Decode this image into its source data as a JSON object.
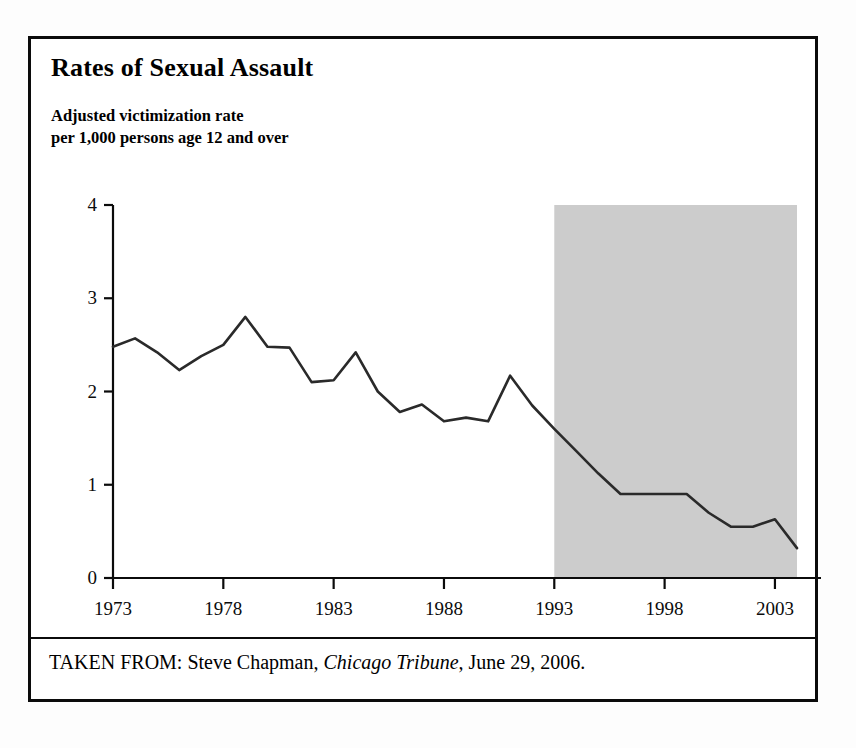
{
  "figure": {
    "title": "Rates of Sexual Assault",
    "subtitle": "Adjusted victimization rate\nper 1,000 persons age 12 and over",
    "caption": {
      "prefix": "TAKEN FROM: Steve Chapman, ",
      "source_italic": "Chicago Tribune",
      "suffix": ", June 29, 2006."
    },
    "colors": {
      "ink": "#0b0b0b",
      "line": "#2a2a2a",
      "shaded_band": "#cccccc",
      "background": "#ffffff"
    }
  },
  "chart_data": {
    "type": "line",
    "title": "Rates of Sexual Assault",
    "subtitle": "Adjusted victimization rate per 1,000 persons age 12 and over",
    "xlabel": "",
    "ylabel": "Adjusted victimization rate per 1,000 persons age 12 and over",
    "xlim": [
      1973,
      2004
    ],
    "ylim": [
      0,
      4
    ],
    "grid": false,
    "legend": null,
    "x_ticks": [
      1973,
      1978,
      1983,
      1988,
      1993,
      1998,
      2003
    ],
    "x_tick_labels": [
      "1973",
      "1978",
      "1983",
      "1988",
      "1993",
      "1998",
      "2003"
    ],
    "y_ticks": [
      0,
      1,
      2,
      3,
      4
    ],
    "y_tick_labels": [
      "0",
      "1",
      "2",
      "3",
      "4"
    ],
    "shaded_region": {
      "x_start": 1993,
      "x_end": 2004,
      "y_start": 0,
      "y_end": 4,
      "color": "#cccccc"
    },
    "series": [
      {
        "name": "Adjusted victimization rate",
        "x": [
          1973,
          1974,
          1975,
          1976,
          1977,
          1978,
          1979,
          1980,
          1981,
          1982,
          1983,
          1984,
          1985,
          1986,
          1987,
          1988,
          1989,
          1990,
          1991,
          1992,
          1993,
          1994,
          1995,
          1996,
          1997,
          1998,
          1999,
          2000,
          2001,
          2002,
          2003,
          2004
        ],
        "values": [
          2.48,
          2.57,
          2.42,
          2.23,
          2.38,
          2.5,
          2.8,
          2.48,
          2.47,
          2.1,
          2.12,
          2.42,
          2.0,
          1.78,
          1.86,
          1.68,
          1.72,
          1.68,
          2.17,
          1.85,
          1.6,
          1.36,
          1.12,
          0.9,
          0.9,
          0.9,
          0.9,
          0.7,
          0.55,
          0.55,
          0.63,
          0.32
        ]
      }
    ]
  },
  "axes_geometry": {
    "plot_left_px": 82,
    "plot_right_px": 766,
    "plot_top_px": 166,
    "plot_bottom_px": 539,
    "x_min_year": 1973,
    "x_max_year": 2004,
    "y_min": 0,
    "y_max": 4
  }
}
